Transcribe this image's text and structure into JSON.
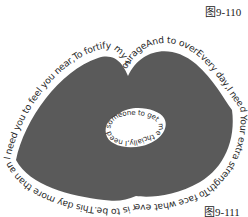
{
  "figures": {
    "top_label": "图9-110",
    "bottom_label": "图9-111"
  },
  "artwork": {
    "shape": "lips",
    "fill_color": "#5a5a5a",
    "hole_color": "#ffffff",
    "outer_text": "I need you to feel you near,To fortify my courageAnd to overEvery day,I need Your extra strengthTo face what ever is to be.This day more than any day,I need to feel you near,To fortify my courage",
    "inner_text": "cially,I need someone to get me through this day espe"
  }
}
